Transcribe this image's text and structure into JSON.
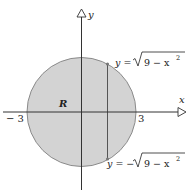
{
  "diagram": {
    "axes": {
      "x_label": "x",
      "y_label": "y",
      "tick_neg": "− 3",
      "tick_pos": "3"
    },
    "region_label": "R",
    "upper_curve": {
      "lhs": "y =",
      "radicand": "9 − x",
      "exponent": "2"
    },
    "lower_curve": {
      "lhs": "y = −",
      "radicand": "9 − x",
      "exponent": "2"
    },
    "colors": {
      "fill": "#d3d3d3",
      "outline": "#8a8a8a",
      "axis": "#333333"
    }
  }
}
